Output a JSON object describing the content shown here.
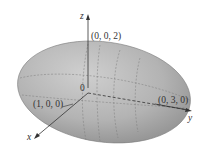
{
  "diagram": {
    "type": "ellipsoid",
    "equation_semiaxes": {
      "a": 1,
      "b": 3,
      "c": 2
    },
    "labels": {
      "z_axis": "z",
      "x_axis": "x",
      "y_axis": "y",
      "origin": "0",
      "point_z": "(0, 0, 2)",
      "point_x": "(1, 0, 0)",
      "point_y": "(0, 3, 0)"
    },
    "colors": {
      "surface": "#b5b5b5",
      "surface_dark": "#8f8f8f",
      "axis": "#333333",
      "grid": "#7a7a7a"
    }
  }
}
